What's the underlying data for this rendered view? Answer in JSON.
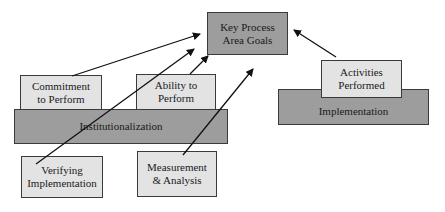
{
  "diagram": {
    "goal": {
      "label": "Key Process\nArea Goals"
    },
    "institutionalization": {
      "base": {
        "label": "Institutionalization"
      },
      "commitment": {
        "label": "Commitment\nto Perform"
      },
      "ability": {
        "label": "Ability to\nPerform"
      },
      "verifying": {
        "label": "Verifying\nImplementation"
      },
      "measurement": {
        "label": "Measurement\n& Analysis"
      }
    },
    "implementation": {
      "base": {
        "label": "Implementation"
      },
      "activities": {
        "label": "Activities\nPerformed"
      }
    },
    "arrows": [
      {
        "from": "Commitment to Perform",
        "to": "Key Process Area Goals"
      },
      {
        "from": "Verifying Implementation",
        "to": "Key Process Area Goals"
      },
      {
        "from": "Ability to Perform",
        "to": "Key Process Area Goals"
      },
      {
        "from": "Measurement & Analysis",
        "to": "Key Process Area Goals"
      },
      {
        "from": "Activities Performed",
        "to": "Key Process Area Goals"
      }
    ],
    "colors": {
      "light_box": "#e3e3e3",
      "dark_box": "#9d9d9d",
      "border": "#3a3a3a"
    }
  }
}
